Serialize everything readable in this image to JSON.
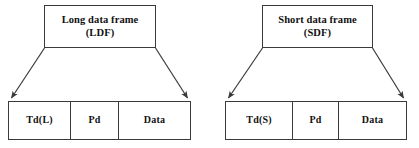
{
  "diagram": {
    "stroke_color": "#3a3a3a",
    "text_color": "#111111",
    "background_color": "#ffffff",
    "groups": [
      {
        "id": "ldf",
        "header": {
          "line1": "Long data frame",
          "line2": "(LDF)"
        },
        "fields": [
          {
            "label": "Td(L)"
          },
          {
            "label": "Pd"
          },
          {
            "label": "Data"
          }
        ],
        "connectors": [
          {
            "name": "left-expansion-arrow",
            "direction": "down-left"
          },
          {
            "name": "right-expansion-arrow",
            "direction": "down-right"
          }
        ]
      },
      {
        "id": "sdf",
        "header": {
          "line1": "Short data frame",
          "line2": "(SDF)"
        },
        "fields": [
          {
            "label": "Td(S)"
          },
          {
            "label": "Pd"
          },
          {
            "label": "Data"
          }
        ],
        "connectors": [
          {
            "name": "left-expansion-arrow",
            "direction": "down-left"
          },
          {
            "name": "right-expansion-arrow",
            "direction": "down-right"
          }
        ]
      }
    ]
  }
}
